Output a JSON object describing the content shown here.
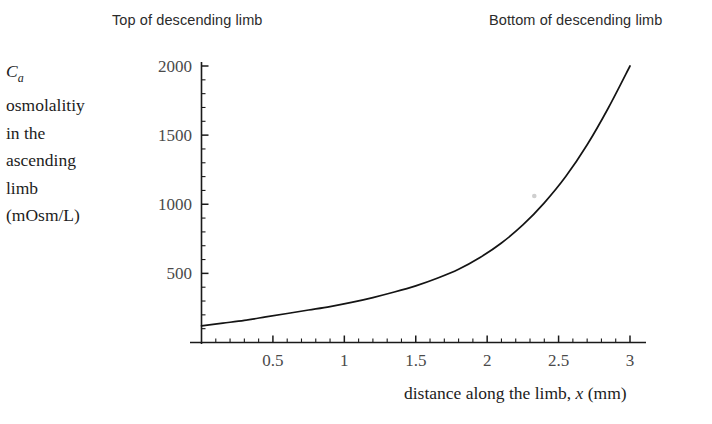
{
  "annotations": {
    "top_left": "Top of descending limb",
    "top_right": "Bottom of descending limb"
  },
  "y_caption": {
    "line1_var": "C",
    "line1_sub": "a",
    "line2": "osmolalitiy",
    "line3": "in the",
    "line4": "ascending",
    "line5": "limb",
    "line6": "(mOsm/L)"
  },
  "x_caption": {
    "before": "distance along the limb, ",
    "var": "x",
    "after": " (mm)"
  },
  "chart_data": {
    "type": "line",
    "title": "",
    "xlabel": "distance along the limb, x (mm)",
    "ylabel": "Ca osmolalitiy in the ascending limb (mOsm/L)",
    "xlim": [
      0,
      3.1
    ],
    "ylim": [
      0,
      2100
    ],
    "grid": false,
    "legend": "none",
    "x_ticks_major": [
      0.5,
      1,
      1.5,
      2,
      2.5,
      3
    ],
    "x_tick_labels": [
      "0.5",
      "1",
      "1.5",
      "2",
      "2.5",
      "3"
    ],
    "x_minor_step": 0.1,
    "y_ticks_major": [
      500,
      1000,
      1500,
      2000
    ],
    "y_tick_labels": [
      "500",
      "1000",
      "1500",
      "2000"
    ],
    "y_minor_step": 100,
    "series": [
      {
        "name": "Ca",
        "x": [
          0.0,
          0.15,
          0.3,
          0.45,
          0.6,
          0.75,
          0.9,
          1.05,
          1.2,
          1.35,
          1.5,
          1.65,
          1.8,
          1.95,
          2.1,
          2.25,
          2.4,
          2.55,
          2.7,
          2.85,
          3.0
        ],
        "values": [
          120,
          140,
          160,
          185,
          210,
          235,
          260,
          290,
          325,
          365,
          410,
          465,
          530,
          615,
          720,
          850,
          1010,
          1200,
          1430,
          1700,
          2000
        ]
      }
    ],
    "annotations": [
      {
        "text": "Top of descending limb",
        "at_x": 0.2,
        "position": "above-axis-left"
      },
      {
        "text": "Bottom of descending limb",
        "at_x": 3.0,
        "position": "above-axis-right"
      }
    ],
    "marker_artifact": {
      "x": 2.33,
      "y": 1060
    }
  }
}
